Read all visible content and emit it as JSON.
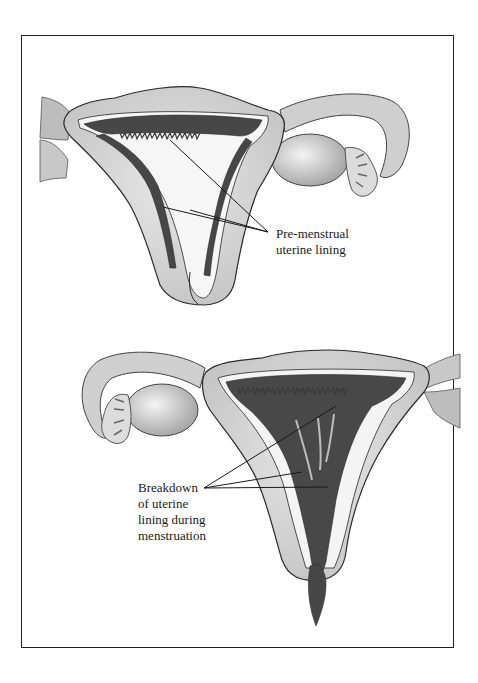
{
  "figure": {
    "top_panel": {
      "title": "Pre-menstrual uterus",
      "label_lines": [
        "Pre-menstrual",
        "uterine lining"
      ]
    },
    "bottom_panel": {
      "title": "Menstruating uterus",
      "label_lines": [
        "Breakdown",
        "of uterine",
        "lining during",
        "menstruation"
      ]
    }
  },
  "colors": {
    "outline": "#2a2a2a",
    "tissue": "#d2d2d2",
    "tissue_light": "#e6e6e6",
    "lining": "#4a4a4a",
    "frame": "#1e1e1e"
  }
}
